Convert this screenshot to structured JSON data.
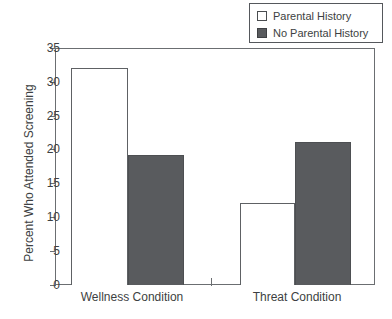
{
  "chart_data": {
    "type": "bar",
    "title": "",
    "xlabel": "",
    "ylabel": "Percent Who Attended Screening",
    "categories": [
      "Wellness Condition",
      "Threat Condition"
    ],
    "series": [
      {
        "name": "Parental History",
        "values": [
          32.0,
          12.1
        ],
        "color": "#ffffff",
        "style": "open"
      },
      {
        "name": "No Parental History",
        "values": [
          19.2,
          21.1
        ],
        "color": "#595b5e",
        "style": "filled"
      }
    ],
    "ylim": [
      0,
      35
    ],
    "yticks": [
      0,
      5,
      10,
      15,
      20,
      25,
      30,
      35
    ],
    "ytick_labels": [
      "0",
      "5",
      "10",
      "15",
      "20",
      "25",
      "30",
      "35"
    ],
    "grid": false,
    "legend_position": "top-right",
    "frame": "box"
  },
  "legend": {
    "entries": [
      {
        "label": "Parental History",
        "swatch": "open-square-swatch"
      },
      {
        "label": "No Parental History",
        "swatch": "filled-square-swatch"
      }
    ]
  },
  "axes": {
    "y_title": "Percent Who Attended Screening",
    "y_tick_labels": [
      "35",
      "30",
      "25",
      "20",
      "15",
      "10",
      "5",
      "0"
    ],
    "x_tick_labels": [
      "Wellness Condition",
      "Threat Condition"
    ]
  }
}
